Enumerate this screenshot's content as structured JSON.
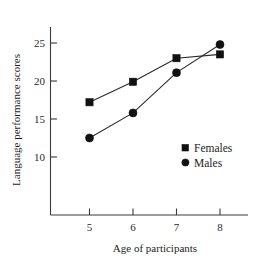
{
  "chart_data": {
    "type": "line",
    "title": "",
    "xlabel": "Age of participants",
    "ylabel": "Language performance scores",
    "x": [
      5,
      6,
      7,
      8
    ],
    "xticklabels": [
      "5",
      "6",
      "7",
      "8"
    ],
    "yticklabels": [
      "10",
      "15",
      "20",
      "25"
    ],
    "yticks": [
      10,
      15,
      20,
      25
    ],
    "xlim": [
      4.4,
      8.6
    ],
    "ylim": [
      7.0,
      26.5
    ],
    "grid": false,
    "legend_position": "center-right",
    "series": [
      {
        "name": "Females",
        "marker": "square",
        "color": "#111111",
        "values": [
          17.2,
          19.9,
          23.0,
          23.5
        ]
      },
      {
        "name": "Males",
        "marker": "circle",
        "color": "#111111",
        "values": [
          12.5,
          15.8,
          21.1,
          24.8
        ]
      }
    ]
  },
  "legend": {
    "items": [
      {
        "label": "Females",
        "marker": "square"
      },
      {
        "label": "Males",
        "marker": "circle"
      }
    ]
  }
}
